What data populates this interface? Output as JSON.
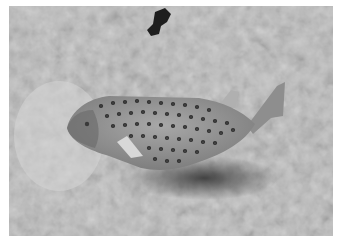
{
  "image": {
    "subject": "spotted boxfish on rocky sand seabed",
    "tone": "grayscale",
    "colors": {
      "border": "#ffffff",
      "seabed_light": "#d4d4d4",
      "seabed_mid": "#a9a9a9",
      "seabed_dark": "#5a5a5a",
      "fish_body": "#9a9a9a",
      "fish_spots": "#2e2e2e",
      "shadow": "#3c3c3c",
      "dark_object": "#1e1e1e"
    }
  }
}
